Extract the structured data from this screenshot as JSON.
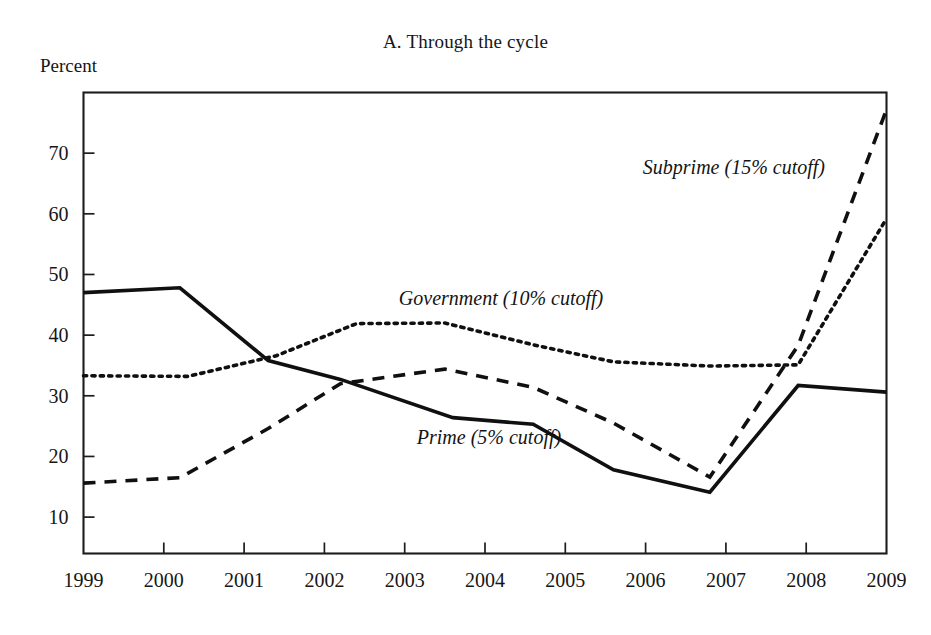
{
  "figure": {
    "title": "A. Through the cycle",
    "y_unit_label": "Percent"
  },
  "chart_data": {
    "type": "line",
    "title": "A. Through the cycle",
    "xlabel": "",
    "ylabel": "Percent",
    "xlim": [
      1999,
      2009
    ],
    "ylim": [
      4,
      80
    ],
    "grid": false,
    "legend_position": "inline-annotations",
    "xticks": [
      1999,
      2000,
      2001,
      2002,
      2003,
      2004,
      2005,
      2006,
      2007,
      2008,
      2009
    ],
    "xtick_labels": [
      "1999",
      "2000",
      "2001",
      "2002",
      "2003",
      "2004",
      "2005",
      "2006",
      "2007",
      "2008",
      "2009"
    ],
    "yticks": [
      10,
      20,
      30,
      40,
      50,
      60,
      70
    ],
    "ytick_labels": [
      "10",
      "20",
      "30",
      "40",
      "50",
      "60",
      "70"
    ],
    "series": [
      {
        "name": "Prime (5% cutoff)",
        "style": "solid",
        "label_x": 2004.05,
        "label_y": 22.0,
        "label_anchor": "middle",
        "x": [
          1999.0,
          2000.2,
          2001.3,
          2002.2,
          2003.6,
          2004.6,
          2005.6,
          2006.8,
          2007.9,
          2009.0
        ],
        "y": [
          47.0,
          47.8,
          35.8,
          32.7,
          26.4,
          25.3,
          17.8,
          14.1,
          31.7,
          30.6
        ]
      },
      {
        "name": "Government (10% cutoff)",
        "style": "dotted",
        "label_x": 2004.2,
        "label_y": 45.0,
        "label_anchor": "middle",
        "x": [
          1999.0,
          2000.3,
          2001.4,
          2002.4,
          2003.5,
          2004.6,
          2005.6,
          2006.8,
          2007.9,
          2009.0
        ],
        "y": [
          33.3,
          33.2,
          36.6,
          41.9,
          42.0,
          38.4,
          35.6,
          34.9,
          35.1,
          59.2
        ]
      },
      {
        "name": "Subprime (15% cutoff)",
        "style": "dashed",
        "label_x": 2007.1,
        "label_y": 66.6,
        "label_anchor": "middle",
        "x": [
          1999.0,
          2000.2,
          2001.3,
          2002.2,
          2003.5,
          2004.6,
          2005.6,
          2006.8,
          2007.9,
          2009.0
        ],
        "y": [
          15.6,
          16.5,
          24.6,
          32.0,
          34.4,
          31.4,
          25.5,
          16.6,
          38.3,
          77.2
        ]
      }
    ]
  }
}
